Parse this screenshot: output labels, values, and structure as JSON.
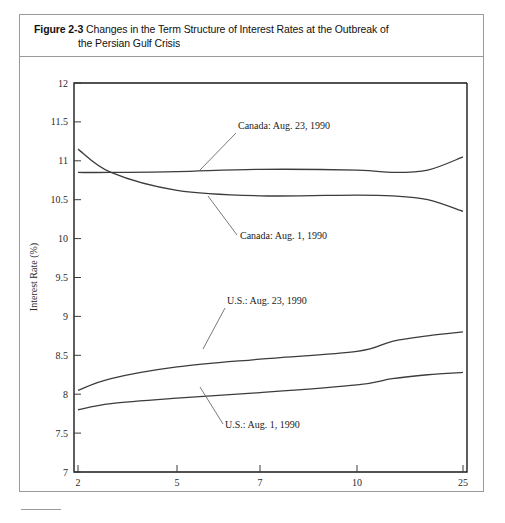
{
  "figure": {
    "label": "Figure 2-3",
    "title_line1": "Changes in the Term Structure of Interest Rates at the Outbreak of",
    "title_line2": "the Persian Gulf Crisis"
  },
  "chart_data": {
    "type": "line",
    "xlabel": "Years to Maturity",
    "ylabel": "Interest Rate (%)",
    "xtick_labels": [
      "2",
      "5",
      "7",
      "10",
      "25"
    ],
    "xtick_values": [
      2,
      5,
      7,
      10,
      25
    ],
    "ytick_labels": [
      "7",
      "7.5",
      "8",
      "8.5",
      "9",
      "9.5",
      "10",
      "10.5",
      "11",
      "11.5",
      "12"
    ],
    "ylim": [
      7,
      12
    ],
    "xlim": [
      2,
      25
    ],
    "x_scale": "compressed-maturity",
    "grid": false,
    "legend": "inline-annotations",
    "series": [
      {
        "name": "Canada: Aug. 23, 1990",
        "label": "Canada: Aug. 23, 1990",
        "x": [
          2,
          3,
          5,
          7,
          10,
          15,
          20,
          25
        ],
        "values": [
          10.85,
          10.85,
          10.86,
          10.89,
          10.88,
          10.85,
          10.88,
          11.05
        ]
      },
      {
        "name": "Canada: Aug. 1, 1990",
        "label": "Canada: Aug. 1, 1990",
        "x": [
          2,
          3,
          5,
          7,
          10,
          15,
          20,
          25
        ],
        "values": [
          11.15,
          10.85,
          10.62,
          10.55,
          10.56,
          10.55,
          10.5,
          10.35
        ]
      },
      {
        "name": "U.S.: Aug. 23, 1990",
        "label": "U.S.: Aug. 23, 1990",
        "x": [
          2,
          3,
          5,
          7,
          10,
          15,
          20,
          25
        ],
        "values": [
          8.05,
          8.2,
          8.35,
          8.45,
          8.55,
          8.68,
          8.75,
          8.8
        ]
      },
      {
        "name": "U.S.: Aug. 1, 1990",
        "label": "U.S.: Aug. 1, 1990",
        "x": [
          2,
          3,
          5,
          7,
          10,
          15,
          20,
          25
        ],
        "values": [
          7.8,
          7.88,
          7.95,
          8.02,
          8.12,
          8.2,
          8.25,
          8.28
        ]
      }
    ]
  }
}
